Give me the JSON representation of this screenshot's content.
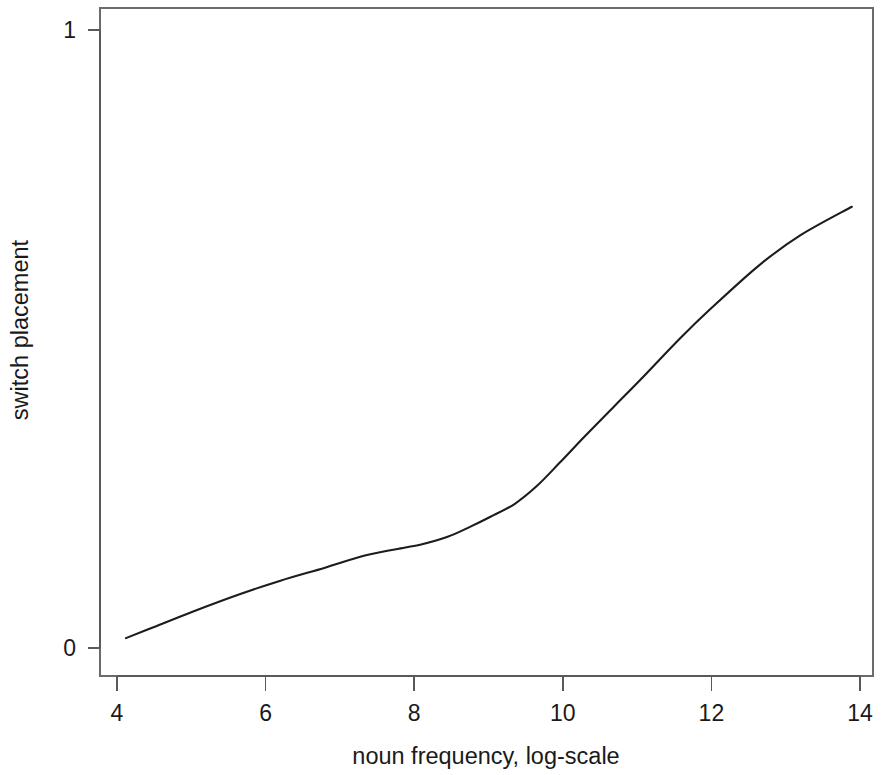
{
  "chart_data": {
    "type": "line",
    "title": "",
    "xlabel": "noun frequency, log-scale",
    "ylabel": "switch placement",
    "xlim": [
      3.85,
      14.25
    ],
    "ylim": [
      -0.055,
      1.03
    ],
    "xticks": [
      4,
      6,
      8,
      10,
      12,
      14
    ],
    "xticklabels": [
      "4",
      "6",
      "8",
      "10",
      "12",
      "14"
    ],
    "yticks": [
      0,
      1
    ],
    "yticklabels": [
      "0",
      "1"
    ],
    "grid": false,
    "legend": "none",
    "series": [
      {
        "name": "fitted switch placement",
        "x": [
          4.12,
          4.5,
          5.0,
          5.65,
          6.2,
          6.8,
          7.35,
          7.9,
          8.08,
          8.45,
          8.75,
          9.02,
          9.35,
          9.65,
          9.96,
          10.3,
          10.7,
          11.1,
          11.57,
          12.0,
          12.65,
          13.2,
          13.89
        ],
        "y": [
          0.016,
          0.034,
          0.058,
          0.087,
          0.109,
          0.13,
          0.15,
          0.163,
          0.167,
          0.18,
          0.196,
          0.212,
          0.233,
          0.262,
          0.3,
          0.343,
          0.392,
          0.441,
          0.5,
          0.55,
          0.62,
          0.668,
          0.714
        ]
      }
    ]
  },
  "axes": {
    "x_title": "noun frequency, log-scale",
    "y_title": "switch placement"
  }
}
